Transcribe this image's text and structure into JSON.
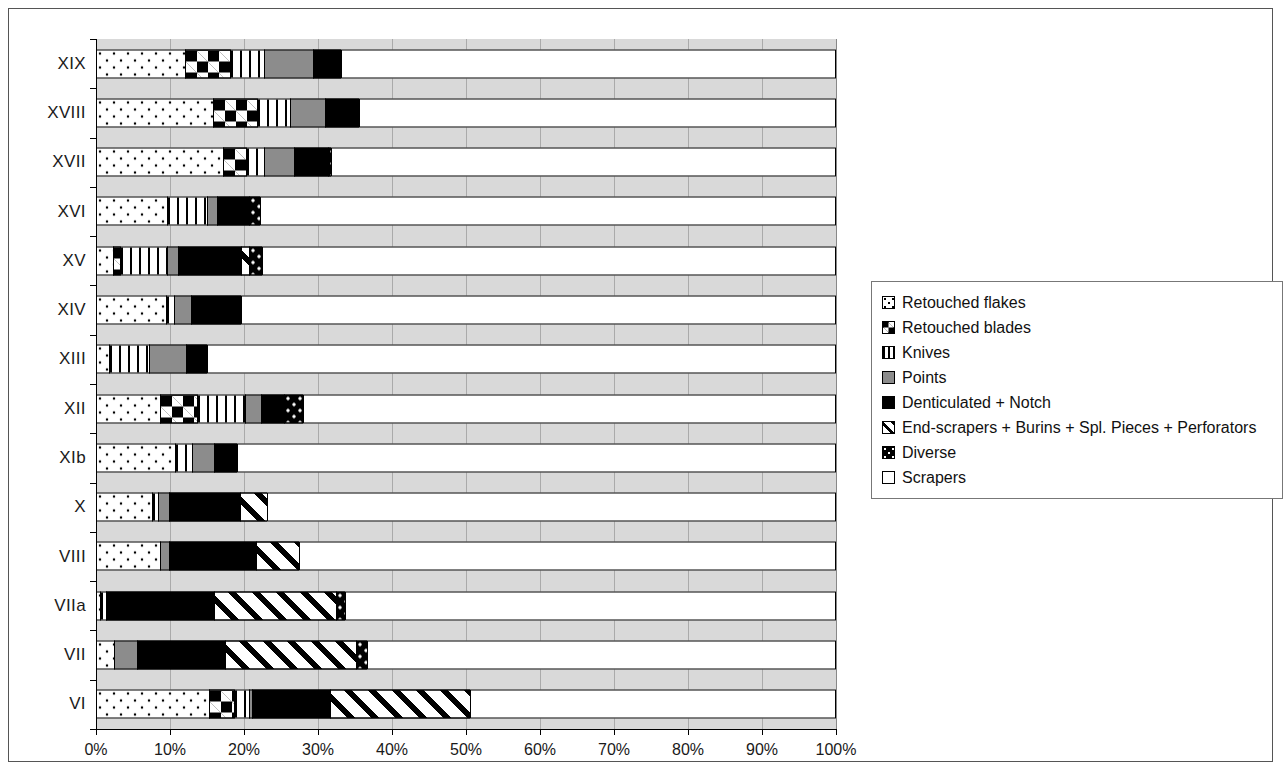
{
  "chart_data": {
    "type": "bar",
    "orientation": "horizontal",
    "stacked": true,
    "normalized": true,
    "title": "",
    "xlabel": "",
    "ylabel": "",
    "xlim": [
      0,
      100
    ],
    "grid": true,
    "legend_position": "right",
    "tick_labels": [
      "0%",
      "10%",
      "20%",
      "30%",
      "40%",
      "50%",
      "60%",
      "70%",
      "80%",
      "90%",
      "100%"
    ],
    "tick_values": [
      0,
      10,
      20,
      30,
      40,
      50,
      60,
      70,
      80,
      90,
      100
    ],
    "categories": [
      "XIX",
      "XVIII",
      "XVII",
      "XVI",
      "XV",
      "XIV",
      "XIII",
      "XII",
      "XIb",
      "X",
      "VIII",
      "VIIa",
      "VII",
      "VI"
    ],
    "series": [
      {
        "name": "Retouched flakes",
        "pattern": "dotted-white",
        "values": [
          12.0,
          15.8,
          17.2,
          9.6,
          2.3,
          9.5,
          1.8,
          8.6,
          10.7,
          7.6,
          8.6,
          0.5,
          2.4,
          15.3
        ]
      },
      {
        "name": "Retouched blades",
        "pattern": "black-white-diamonds",
        "values": [
          6.1,
          5.9,
          3.1,
          0.0,
          0.9,
          0.0,
          0.0,
          5.0,
          0.0,
          0.0,
          0.0,
          0.0,
          0.0,
          3.4
        ]
      },
      {
        "name": "Knives",
        "pattern": "vertical-stripes",
        "values": [
          4.6,
          4.5,
          2.4,
          5.4,
          6.4,
          1.1,
          5.3,
          6.5,
          2.3,
          0.8,
          0.0,
          0.9,
          0.0,
          2.0
        ]
      },
      {
        "name": "Points",
        "pattern": "solid-grey",
        "values": [
          6.6,
          4.7,
          4.1,
          1.4,
          1.5,
          2.2,
          5.1,
          2.2,
          3.0,
          1.5,
          1.2,
          0.0,
          3.1,
          0.4
        ]
      },
      {
        "name": "Denticulated + Notch",
        "pattern": "solid-black",
        "values": [
          3.8,
          4.7,
          4.5,
          4.3,
          8.5,
          6.8,
          2.8,
          3.1,
          3.0,
          9.6,
          11.8,
          14.6,
          11.9,
          10.5
        ]
      },
      {
        "name": "End-scrapers + Burins + Spl. Pieces + Perforators",
        "pattern": "diagonal-stripes",
        "values": [
          0.0,
          0.0,
          0.0,
          0.0,
          1.1,
          0.0,
          0.0,
          0.0,
          0.0,
          3.6,
          5.8,
          16.5,
          17.8,
          19.0
        ]
      },
      {
        "name": "Diverse",
        "pattern": "black-white-dots",
        "values": [
          0.0,
          0.0,
          0.5,
          1.5,
          1.8,
          0.0,
          0.0,
          2.6,
          0.0,
          0.0,
          0.0,
          1.1,
          1.4,
          0.0
        ]
      },
      {
        "name": "Scrapers",
        "pattern": "solid-white",
        "values": [
          66.9,
          64.4,
          68.2,
          77.8,
          77.5,
          80.4,
          85.0,
          72.0,
          81.0,
          76.9,
          72.6,
          66.4,
          63.4,
          49.4
        ]
      }
    ]
  },
  "legend": {
    "items": [
      {
        "label": "Retouched flakes",
        "swatch": "p-flakes"
      },
      {
        "label": "Retouched blades",
        "swatch": "p-blades"
      },
      {
        "label": "Knives",
        "swatch": "p-knives"
      },
      {
        "label": "Points",
        "swatch": "p-points"
      },
      {
        "label": "Denticulated + Notch",
        "swatch": "p-dent"
      },
      {
        "label": "End-scrapers + Burins + Spl. Pieces + Perforators",
        "swatch": "p-end"
      },
      {
        "label": "Diverse",
        "swatch": "p-diverse"
      },
      {
        "label": "Scrapers",
        "swatch": "p-scrapers"
      }
    ]
  }
}
